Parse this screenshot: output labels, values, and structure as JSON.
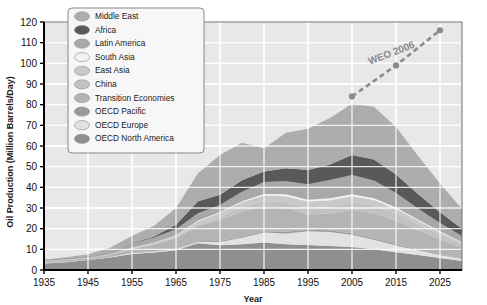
{
  "chart_data": {
    "type": "area",
    "title": "",
    "xlabel": "Year",
    "ylabel": "Oil Production (Million Barrels/Day)",
    "xlim": [
      1935,
      2030
    ],
    "ylim": [
      0,
      120
    ],
    "xticks": [
      1935,
      1945,
      1955,
      1965,
      1975,
      1985,
      1995,
      2005,
      2015,
      2025
    ],
    "yticks": [
      0,
      10,
      20,
      30,
      40,
      50,
      60,
      70,
      80,
      90,
      100,
      110,
      120
    ],
    "grid": true,
    "legend_position": "top-left",
    "stacked": true,
    "x": [
      1935,
      1940,
      1945,
      1950,
      1955,
      1960,
      1965,
      1970,
      1975,
      1980,
      1985,
      1990,
      1995,
      2000,
      2005,
      2010,
      2015,
      2020,
      2025,
      2030
    ],
    "series": [
      {
        "name": "OECD North America",
        "color": "#8f8f8f",
        "values": [
          3.2,
          3.8,
          4.8,
          6.0,
          7.8,
          8.5,
          9.6,
          12.9,
          12.0,
          12.4,
          13.3,
          12.5,
          12.1,
          11.6,
          11.1,
          10.0,
          8.6,
          7.2,
          5.8,
          4.4
        ]
      },
      {
        "name": "OECD Europe",
        "color": "#e2e2e2",
        "values": [
          0.2,
          0.2,
          0.2,
          0.3,
          0.4,
          0.5,
          0.6,
          0.7,
          1.6,
          3.2,
          4.8,
          5.2,
          6.6,
          6.8,
          5.9,
          4.6,
          3.3,
          2.3,
          1.5,
          1.0
        ]
      },
      {
        "name": "OECD Pacific",
        "color": "#9a9a9a",
        "values": [
          0.1,
          0.1,
          0.1,
          0.1,
          0.2,
          0.2,
          0.2,
          0.3,
          0.4,
          0.5,
          0.7,
          0.8,
          0.8,
          0.8,
          0.7,
          0.6,
          0.5,
          0.4,
          0.3,
          0.2
        ]
      },
      {
        "name": "Transition Economies",
        "color": "#b4b4b4",
        "values": [
          0.5,
          0.7,
          0.6,
          0.9,
          1.7,
          3.1,
          5.0,
          7.5,
          10.2,
          12.2,
          12.1,
          11.5,
          7.4,
          8.1,
          11.4,
          12.2,
          11.4,
          9.4,
          7.2,
          5.2
        ]
      },
      {
        "name": "China",
        "color": "#c2c2c2",
        "values": [
          0.0,
          0.0,
          0.0,
          0.0,
          0.1,
          0.2,
          0.3,
          0.6,
          1.5,
          2.1,
          2.5,
          2.8,
          3.0,
          3.2,
          3.6,
          3.8,
          3.5,
          2.9,
          2.2,
          1.6
        ]
      },
      {
        "name": "East Asia",
        "color": "#c9c9c9",
        "values": [
          0.2,
          0.3,
          0.2,
          0.3,
          0.5,
          0.7,
          0.9,
          1.6,
          2.0,
          2.4,
          2.6,
          2.9,
          3.2,
          3.3,
          3.1,
          2.7,
          2.2,
          1.7,
          1.3,
          0.9
        ]
      },
      {
        "name": "South Asia",
        "color": "#f2f2f2",
        "values": [
          0.0,
          0.0,
          0.0,
          0.0,
          0.1,
          0.1,
          0.2,
          0.3,
          0.4,
          0.5,
          0.8,
          0.9,
          0.9,
          0.9,
          0.9,
          0.8,
          0.7,
          0.5,
          0.4,
          0.3
        ]
      },
      {
        "name": "Latin America",
        "color": "#a8a8a8",
        "values": [
          0.5,
          0.6,
          0.8,
          1.2,
          1.9,
          2.4,
          2.9,
          3.6,
          3.4,
          4.6,
          5.8,
          6.4,
          7.5,
          8.8,
          9.3,
          8.6,
          7.0,
          5.4,
          4.0,
          2.8
        ]
      },
      {
        "name": "Africa",
        "color": "#595959",
        "values": [
          0.1,
          0.1,
          0.1,
          0.2,
          0.3,
          0.5,
          2.2,
          5.8,
          4.9,
          5.5,
          5.1,
          6.2,
          6.9,
          7.6,
          9.6,
          10.2,
          9.0,
          7.0,
          5.2,
          3.6
        ]
      },
      {
        "name": "Middle East",
        "color": "#adadad",
        "values": [
          0.3,
          0.4,
          0.8,
          1.8,
          3.4,
          5.2,
          8.1,
          13.5,
          19.3,
          18.2,
          11.2,
          17.2,
          19.9,
          22.5,
          24.9,
          25.5,
          23.0,
          18.5,
          14.0,
          9.5
        ]
      }
    ],
    "annotation_series": {
      "name": "WEO 2006",
      "label": "WEO 2006",
      "style": "dashed-with-markers",
      "color": "#8a8a8a",
      "points": [
        {
          "x": 2005,
          "y": 84
        },
        {
          "x": 2015,
          "y": 99
        },
        {
          "x": 2025,
          "y": 116
        }
      ]
    }
  },
  "legend": {
    "items": [
      {
        "label": "Middle East",
        "color": "#adadad"
      },
      {
        "label": "Africa",
        "color": "#595959"
      },
      {
        "label": "Latin America",
        "color": "#a8a8a8"
      },
      {
        "label": "South Asia",
        "color": "#f2f2f2"
      },
      {
        "label": "East Asia",
        "color": "#c9c9c9"
      },
      {
        "label": "China",
        "color": "#c2c2c2"
      },
      {
        "label": "Transition Economies",
        "color": "#b4b4b4"
      },
      {
        "label": "OECD Pacific",
        "color": "#9a9a9a"
      },
      {
        "label": "OECD Europe",
        "color": "#e2e2e2"
      },
      {
        "label": "OECD North America",
        "color": "#8f8f8f"
      }
    ]
  },
  "style": {
    "plot_background": "#e8e8e8",
    "grid_color": "#ffffff",
    "axis_color": "#000000",
    "legend_background": "#f7f7f7",
    "legend_border": "#888888"
  }
}
